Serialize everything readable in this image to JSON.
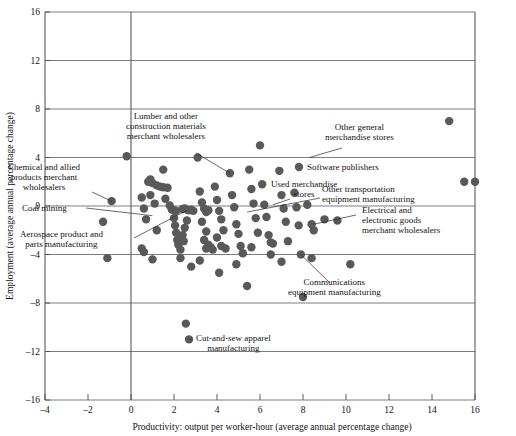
{
  "chart_data": {
    "type": "scatter",
    "title": "",
    "xlabel": "Productivity: output per worker-hour (average annual percentage change)",
    "ylabel": "Employment (average annual percentage change)",
    "xlim": [
      -4,
      16
    ],
    "ylim": [
      -16,
      16
    ],
    "xticks": [
      "-4",
      "-2",
      "0",
      "2",
      "4",
      "6",
      "8",
      "10",
      "12",
      "14",
      "16"
    ],
    "yticks": [
      "16",
      "12",
      "8",
      "4",
      "0",
      "-4",
      "-8",
      "-12",
      "-16"
    ],
    "xtick_values": [
      -4,
      -2,
      0,
      2,
      4,
      6,
      8,
      10,
      12,
      14,
      16
    ],
    "ytick_values": [
      16,
      12,
      8,
      4,
      0,
      -4,
      -8,
      -12,
      -16
    ],
    "grid": "horizontal-major-plus-zero-vertical",
    "legend": "none",
    "marker_color": "#595959",
    "marker_size": 4.2,
    "points": [
      [
        -0.2,
        4.1
      ],
      [
        -0.9,
        0.4
      ],
      [
        -1.3,
        -1.3
      ],
      [
        -1.1,
        -4.3
      ],
      [
        0.5,
        0.7
      ],
      [
        0.6,
        -0.2
      ],
      [
        0.7,
        -1.1
      ],
      [
        0.5,
        -3.5
      ],
      [
        0.6,
        -3.8
      ],
      [
        0.8,
        2.0
      ],
      [
        0.9,
        2.2
      ],
      [
        1.0,
        1.9
      ],
      [
        1.2,
        1.7
      ],
      [
        1.35,
        1.6
      ],
      [
        1.5,
        1.55
      ],
      [
        1.7,
        1.5
      ],
      [
        0.9,
        0.9
      ],
      [
        1.1,
        0.2
      ],
      [
        1.2,
        -2.0
      ],
      [
        1.0,
        -4.4
      ],
      [
        1.5,
        3.0
      ],
      [
        1.6,
        0.6
      ],
      [
        1.8,
        0.05
      ],
      [
        1.9,
        -0.3
      ],
      [
        2.0,
        -0.35
      ],
      [
        2.1,
        -0.4
      ],
      [
        2.0,
        -1.0
      ],
      [
        2.05,
        -1.6
      ],
      [
        2.1,
        -2.2
      ],
      [
        2.15,
        -2.8
      ],
      [
        2.2,
        -3.2
      ],
      [
        2.3,
        -3.6
      ],
      [
        2.4,
        -0.25
      ],
      [
        2.5,
        -0.2
      ],
      [
        2.6,
        -0.3
      ],
      [
        2.7,
        -0.35
      ],
      [
        2.8,
        -0.3
      ],
      [
        2.9,
        -0.4
      ],
      [
        2.6,
        -1.2
      ],
      [
        2.5,
        -1.8
      ],
      [
        2.4,
        -2.4
      ],
      [
        2.45,
        -2.9
      ],
      [
        2.3,
        -4.3
      ],
      [
        2.8,
        -5.0
      ],
      [
        2.55,
        -9.7
      ],
      [
        2.7,
        -11.0
      ],
      [
        3.1,
        4.0
      ],
      [
        3.2,
        1.2
      ],
      [
        3.3,
        0.3
      ],
      [
        3.4,
        -0.2
      ],
      [
        3.5,
        -0.5
      ],
      [
        3.6,
        -0.35
      ],
      [
        3.3,
        -1.3
      ],
      [
        3.5,
        -2.1
      ],
      [
        3.4,
        -2.8
      ],
      [
        3.6,
        -3.2
      ],
      [
        3.5,
        -3.5
      ],
      [
        3.7,
        -3.4
      ],
      [
        3.8,
        -3.6
      ],
      [
        3.2,
        -4.5
      ],
      [
        3.9,
        1.6
      ],
      [
        4.0,
        0.5
      ],
      [
        4.1,
        -0.4
      ],
      [
        4.2,
        -1.1
      ],
      [
        4.3,
        -2.0
      ],
      [
        4.0,
        -2.6
      ],
      [
        4.2,
        -3.3
      ],
      [
        4.4,
        -3.5
      ],
      [
        4.1,
        -5.5
      ],
      [
        4.6,
        2.7
      ],
      [
        4.7,
        0.9
      ],
      [
        4.8,
        -0.1
      ],
      [
        4.9,
        -1.5
      ],
      [
        5.0,
        -2.3
      ],
      [
        5.1,
        -3.3
      ],
      [
        5.2,
        -3.9
      ],
      [
        4.9,
        -4.8
      ],
      [
        5.5,
        3.0
      ],
      [
        5.6,
        1.4
      ],
      [
        5.7,
        0.2
      ],
      [
        5.8,
        -1.0
      ],
      [
        5.9,
        -2.2
      ],
      [
        5.6,
        -3.4
      ],
      [
        5.4,
        -6.6
      ],
      [
        6.0,
        5.0
      ],
      [
        6.1,
        1.8
      ],
      [
        6.2,
        0.1
      ],
      [
        6.3,
        -0.9
      ],
      [
        6.4,
        -2.4
      ],
      [
        6.5,
        -3.0
      ],
      [
        6.6,
        -3.1
      ],
      [
        6.5,
        -4.0
      ],
      [
        6.9,
        2.9
      ],
      [
        7.0,
        0.9
      ],
      [
        7.1,
        -0.2
      ],
      [
        7.2,
        -1.3
      ],
      [
        7.3,
        -2.9
      ],
      [
        7.0,
        -4.6
      ],
      [
        7.6,
        1.1
      ],
      [
        7.7,
        -0.1
      ],
      [
        7.8,
        -1.6
      ],
      [
        7.9,
        -4.0
      ],
      [
        8.2,
        0.1
      ],
      [
        8.4,
        -1.5
      ],
      [
        8.5,
        -2.0
      ],
      [
        8.4,
        -4.3
      ],
      [
        8.0,
        -7.5
      ],
      [
        9.0,
        -1.1
      ],
      [
        9.6,
        -1.2
      ],
      [
        10.2,
        -4.8
      ],
      [
        14.8,
        7.0
      ],
      [
        15.5,
        2.0
      ],
      [
        16.0,
        2.0
      ]
    ],
    "annotations": [
      {
        "id": "lumber",
        "label": "Lumber and other\nconstruction materials\nmerchant wholesalers",
        "lines": [
          "Lumber and other",
          "construction materials",
          "merchant wholesalers"
        ],
        "point": [
          4.6,
          2.7
        ]
      },
      {
        "id": "chemical",
        "label": "Chemical and allied\nproducts merchant\nwholesalers",
        "lines": [
          "Chemical and allied",
          "products merchant",
          "wholesalers"
        ],
        "point": [
          -0.9,
          0.4
        ]
      },
      {
        "id": "coal-mining",
        "label": "Coal mining",
        "lines": [
          "Coal mining"
        ],
        "point": [
          1.0,
          -0.8
        ]
      },
      {
        "id": "aerospace",
        "label": "Aerospace product and\nparts manufacturing",
        "lines": [
          "Aerospace product and",
          "parts manufacturing"
        ],
        "point": [
          2.6,
          -0.35
        ]
      },
      {
        "id": "other-general-merch",
        "label": "Other general\nmerchandise stores",
        "lines": [
          "Other general",
          "merchandise stores"
        ],
        "point": [
          8.3,
          4.0
        ]
      },
      {
        "id": "software-publishers",
        "label": "Software publishers",
        "lines": [
          "Software publishers"
        ],
        "point": [
          7.3,
          2.9
        ]
      },
      {
        "id": "used-merchandise",
        "label": "Used merchandise\nstores",
        "lines": [
          "Used merchandise",
          "stores"
        ],
        "point": [
          6.6,
          0.1
        ]
      },
      {
        "id": "other-transportation",
        "label": "Other transportation\nequipment manufacturing",
        "lines": [
          "Other transportation",
          "equipment manufacturing"
        ],
        "point": [
          5.4,
          -0.5
        ]
      },
      {
        "id": "electrical-electronic",
        "label": "Electrical and\nelectronic goods\nmerchant wholesalers",
        "lines": [
          "Electrical and",
          "electronic goods",
          "merchant wholesalers"
        ],
        "point": [
          8.5,
          -1.5
        ]
      },
      {
        "id": "communications",
        "label": "Communications\nequipment manufacturing",
        "lines": [
          "Communications",
          "equipment manufacturing"
        ],
        "point": [
          7.9,
          -4.0
        ]
      },
      {
        "id": "cut-and-sew",
        "label": "Cut-and-sew apparel\nmanufacturing",
        "lines": [
          "Cut-and-sew apparel",
          "manufacturing"
        ],
        "point": [
          2.7,
          -11.0
        ]
      }
    ]
  }
}
